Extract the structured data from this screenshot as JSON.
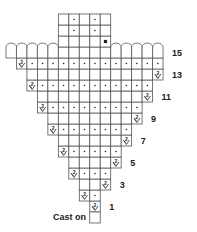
{
  "diagram": {
    "type": "knitting-chart",
    "columns": 15,
    "legend_symbols": {
      "blank": "knit stitch (empty square)",
      "dot": "purl stitch (dot)",
      "inc": "increase (2 over V)",
      "bobble_square": "filled square",
      "arc": "arched top cell"
    },
    "cast_on": {
      "label": "Cast on",
      "col": 8
    },
    "rows": [
      {
        "row": 1,
        "label": "1",
        "start_col": 8,
        "cells": [
          "inc"
        ]
      },
      {
        "row": 2,
        "label": "",
        "start_col": 7,
        "cells": [
          "inc",
          "dot"
        ]
      },
      {
        "row": 3,
        "label": "3",
        "start_col": 7,
        "cells": [
          "blank",
          "blank",
          "inc"
        ]
      },
      {
        "row": 4,
        "label": "",
        "start_col": 6,
        "cells": [
          "inc",
          "dot",
          "dot",
          "dot"
        ]
      },
      {
        "row": 5,
        "label": "5",
        "start_col": 6,
        "cells": [
          "blank",
          "blank",
          "blank",
          "blank",
          "inc"
        ]
      },
      {
        "row": 6,
        "label": "",
        "start_col": 5,
        "cells": [
          "inc",
          "dot",
          "dot",
          "dot",
          "dot",
          "dot"
        ]
      },
      {
        "row": 7,
        "label": "7",
        "start_col": 5,
        "cells": [
          "blank",
          "blank",
          "blank",
          "blank",
          "blank",
          "blank",
          "inc"
        ]
      },
      {
        "row": 8,
        "label": "",
        "start_col": 4,
        "cells": [
          "inc",
          "dot",
          "dot",
          "dot",
          "dot",
          "dot",
          "dot",
          "dot"
        ]
      },
      {
        "row": 9,
        "label": "9",
        "start_col": 4,
        "cells": [
          "blank",
          "blank",
          "blank",
          "blank",
          "blank",
          "blank",
          "blank",
          "blank",
          "inc"
        ]
      },
      {
        "row": 10,
        "label": "",
        "start_col": 3,
        "cells": [
          "inc",
          "dot",
          "dot",
          "dot",
          "dot",
          "dot",
          "dot",
          "dot",
          "dot",
          "dot"
        ]
      },
      {
        "row": 11,
        "label": "11",
        "start_col": 3,
        "cells": [
          "blank",
          "blank",
          "blank",
          "blank",
          "blank",
          "blank",
          "blank",
          "blank",
          "blank",
          "blank",
          "inc"
        ]
      },
      {
        "row": 12,
        "label": "",
        "start_col": 2,
        "cells": [
          "inc",
          "dot",
          "dot",
          "dot",
          "dot",
          "dot",
          "dot",
          "dot",
          "dot",
          "dot",
          "dot",
          "dot"
        ]
      },
      {
        "row": 13,
        "label": "13",
        "start_col": 2,
        "cells": [
          "blank",
          "blank",
          "blank",
          "blank",
          "blank",
          "blank",
          "blank",
          "blank",
          "blank",
          "blank",
          "blank",
          "blank",
          "inc"
        ]
      },
      {
        "row": 14,
        "label": "",
        "start_col": 1,
        "cells": [
          "inc",
          "dot",
          "dot",
          "dot",
          "dot",
          "dot",
          "dot",
          "dot",
          "dot",
          "dot",
          "dot",
          "dot",
          "dot",
          "dot"
        ]
      },
      {
        "row": 15,
        "label": "15",
        "start_col": 0,
        "cells": [
          "arc",
          "arc",
          "arc",
          "arc",
          "arc",
          "blank",
          "blank",
          "blank",
          "blank",
          "blank",
          "arc",
          "arc",
          "arc",
          "arc",
          "arc"
        ]
      },
      {
        "row": 16,
        "label": "",
        "start_col": 5,
        "cells": [
          "blank",
          "blank",
          "blank",
          "blank",
          "bobble_square"
        ]
      },
      {
        "row": 17,
        "label": "",
        "start_col": 5,
        "cells": [
          "blank",
          "dot",
          "blank",
          "dot",
          "blank"
        ]
      },
      {
        "row": 18,
        "label": "",
        "start_col": 5,
        "cells": [
          "blank",
          "dot",
          "blank",
          "dot",
          "blank"
        ]
      }
    ],
    "colors": {
      "grid": "#555555",
      "ink": "#222222",
      "background": "#ffffff"
    }
  }
}
